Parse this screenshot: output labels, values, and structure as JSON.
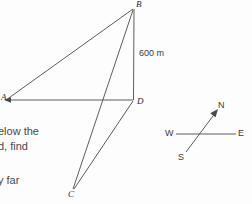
{
  "figure": {
    "stroke_color": "#4a4a4a",
    "background_color": "#fdfdfd",
    "vertices": [
      {
        "id": "A",
        "label": "A",
        "x": 5,
        "y": 100
      },
      {
        "id": "B",
        "label": "B",
        "x": 134,
        "y": 8
      },
      {
        "id": "C",
        "label": "C",
        "x": 73,
        "y": 190
      },
      {
        "id": "D",
        "label": "D",
        "x": 133,
        "y": 100
      }
    ],
    "edges": [
      {
        "id": "AB",
        "from": "A",
        "to": "B"
      },
      {
        "id": "BD",
        "from": "B",
        "to": "D"
      },
      {
        "id": "AD",
        "from": "A",
        "to": "D"
      },
      {
        "id": "BC",
        "from": "B",
        "to": "C"
      },
      {
        "id": "DC",
        "from": "D",
        "to": "C"
      }
    ],
    "measurements": [
      {
        "id": "BD-length",
        "label": "600 m",
        "edge": "BD"
      }
    ]
  },
  "compass": {
    "north_label": "N",
    "south_label": "S",
    "west_label": "W",
    "east_label": "E"
  },
  "body_text": {
    "line1": "elow the",
    "line2": "d, find",
    "line3": "y far"
  }
}
